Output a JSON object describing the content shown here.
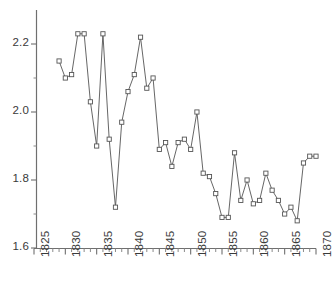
{
  "chart_data": {
    "type": "line",
    "title": "",
    "subtitle": "",
    "xlabel": "",
    "ylabel": "",
    "xlim": [
      1825,
      1870
    ],
    "ylim": [
      1.6,
      2.25
    ],
    "grid": false,
    "legend": null,
    "marker": "open-square",
    "line_color": "#555555",
    "marker_edge_color": "#555555",
    "marker_face_color": "#ffffff",
    "xticks": [
      1825,
      1830,
      1835,
      1840,
      1845,
      1850,
      1855,
      1860,
      1865,
      1870
    ],
    "xtick_labels": [
      "1825",
      "1830",
      "1835",
      "1840",
      "1845",
      "1850",
      "1855",
      "1860",
      "1865",
      "1870"
    ],
    "xtick_minor_step": 1,
    "yticks": [
      1.6,
      1.8,
      2.0,
      2.2
    ],
    "ytick_labels": [
      "1.6",
      "1.8",
      "2.0",
      "2.2"
    ],
    "ytick_minor": [
      1.7,
      1.9,
      2.1
    ],
    "x": [
      1829,
      1830,
      1831,
      1832,
      1833,
      1834,
      1835,
      1836,
      1837,
      1838,
      1839,
      1840,
      1841,
      1842,
      1843,
      1844,
      1845,
      1846,
      1847,
      1848,
      1849,
      1850,
      1851,
      1852,
      1853,
      1854,
      1855,
      1856,
      1857,
      1858,
      1859,
      1860,
      1861,
      1862,
      1863,
      1864,
      1865,
      1866,
      1867,
      1868,
      1869,
      1870
    ],
    "y": [
      2.15,
      2.1,
      2.11,
      2.23,
      2.23,
      2.03,
      1.9,
      2.23,
      1.92,
      1.72,
      1.97,
      2.06,
      2.11,
      2.22,
      2.07,
      2.1,
      1.89,
      1.91,
      1.84,
      1.91,
      1.92,
      1.89,
      2.0,
      1.82,
      1.81,
      1.76,
      1.69,
      1.69,
      1.88,
      1.74,
      1.8,
      1.73,
      1.74,
      1.82,
      1.77,
      1.74,
      1.7,
      1.72,
      1.68,
      1.85,
      1.87,
      1.87
    ]
  },
  "axis": {
    "y_axis_name": "y-axis",
    "x_axis_name": "x-axis"
  }
}
